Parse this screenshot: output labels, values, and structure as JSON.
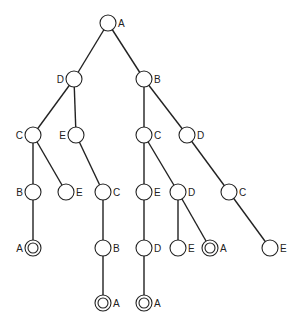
{
  "diagram": {
    "type": "tree",
    "node_radius": 8,
    "nodes": [
      {
        "id": "n0",
        "label": "A",
        "x": 108,
        "y": 23,
        "label_side": "right",
        "accepting": false
      },
      {
        "id": "n1",
        "label": "D",
        "x": 74,
        "y": 79,
        "label_side": "left",
        "accepting": false
      },
      {
        "id": "n2",
        "label": "B",
        "x": 144,
        "y": 79,
        "label_side": "right",
        "accepting": false
      },
      {
        "id": "n3",
        "label": "C",
        "x": 33,
        "y": 135,
        "label_side": "left",
        "accepting": false
      },
      {
        "id": "n4",
        "label": "E",
        "x": 76,
        "y": 135,
        "label_side": "left",
        "accepting": false
      },
      {
        "id": "n5",
        "label": "C",
        "x": 144,
        "y": 135,
        "label_side": "right",
        "accepting": false
      },
      {
        "id": "n6",
        "label": "D",
        "x": 187,
        "y": 135,
        "label_side": "right",
        "accepting": false
      },
      {
        "id": "n7",
        "label": "B",
        "x": 33,
        "y": 192,
        "label_side": "left",
        "accepting": false
      },
      {
        "id": "n8",
        "label": "E",
        "x": 66,
        "y": 192,
        "label_side": "right",
        "accepting": false
      },
      {
        "id": "n9",
        "label": "C",
        "x": 103,
        "y": 192,
        "label_side": "right",
        "accepting": false
      },
      {
        "id": "n10",
        "label": "E",
        "x": 144,
        "y": 192,
        "label_side": "right",
        "accepting": false
      },
      {
        "id": "n11",
        "label": "D",
        "x": 178,
        "y": 192,
        "label_side": "right",
        "accepting": false
      },
      {
        "id": "n12",
        "label": "C",
        "x": 229,
        "y": 192,
        "label_side": "right",
        "accepting": false
      },
      {
        "id": "n13",
        "label": "A",
        "x": 33,
        "y": 248,
        "label_side": "left",
        "accepting": true
      },
      {
        "id": "n14",
        "label": "B",
        "x": 103,
        "y": 248,
        "label_side": "right",
        "accepting": false
      },
      {
        "id": "n15",
        "label": "D",
        "x": 144,
        "y": 248,
        "label_side": "right",
        "accepting": false
      },
      {
        "id": "n16",
        "label": "E",
        "x": 178,
        "y": 248,
        "label_side": "right",
        "accepting": false
      },
      {
        "id": "n17",
        "label": "A",
        "x": 210,
        "y": 248,
        "label_side": "right",
        "accepting": true
      },
      {
        "id": "n18",
        "label": "E",
        "x": 270,
        "y": 248,
        "label_side": "right",
        "accepting": false
      },
      {
        "id": "n19",
        "label": "A",
        "x": 103,
        "y": 303,
        "label_side": "right",
        "accepting": true
      },
      {
        "id": "n20",
        "label": "A",
        "x": 144,
        "y": 303,
        "label_side": "right",
        "accepting": true
      }
    ],
    "edges": [
      [
        "n0",
        "n1"
      ],
      [
        "n0",
        "n2"
      ],
      [
        "n1",
        "n3"
      ],
      [
        "n1",
        "n4"
      ],
      [
        "n2",
        "n5"
      ],
      [
        "n2",
        "n6"
      ],
      [
        "n3",
        "n7"
      ],
      [
        "n3",
        "n8"
      ],
      [
        "n4",
        "n9"
      ],
      [
        "n5",
        "n10"
      ],
      [
        "n5",
        "n11"
      ],
      [
        "n6",
        "n12"
      ],
      [
        "n7",
        "n13"
      ],
      [
        "n9",
        "n14"
      ],
      [
        "n10",
        "n15"
      ],
      [
        "n11",
        "n16"
      ],
      [
        "n11",
        "n17"
      ],
      [
        "n12",
        "n18"
      ],
      [
        "n14",
        "n19"
      ],
      [
        "n15",
        "n20"
      ]
    ]
  }
}
